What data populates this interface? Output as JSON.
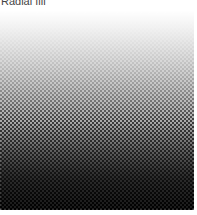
{
  "label": "Radial fill",
  "fill": {
    "type": "halftone-gradient",
    "direction": "top-to-bottom",
    "start_color": "#ffffff",
    "end_color": "#000000",
    "dot_pitch": 4
  }
}
